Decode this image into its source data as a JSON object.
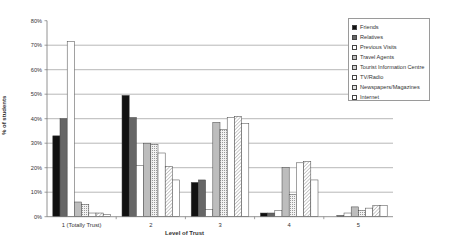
{
  "chart_data": {
    "type": "bar",
    "title": "",
    "xlabel": "Level of Trust",
    "ylabel": "% of students",
    "ylim": [
      0,
      80
    ],
    "yticks": [
      "0%",
      "10%",
      "20%",
      "30%",
      "40%",
      "50%",
      "60%",
      "70%",
      "80%"
    ],
    "grid": true,
    "legend_position": "right",
    "categories": [
      "1 (Totally Trust)",
      "2",
      "3",
      "4",
      "5"
    ],
    "series": [
      {
        "name": "Friends",
        "values": [
          33,
          49.5,
          14,
          1.5,
          0
        ],
        "fill": "#111111",
        "pattern": "solid"
      },
      {
        "name": "Relatives",
        "values": [
          40,
          40.5,
          15,
          1.5,
          0.5
        ],
        "fill": "#666666",
        "pattern": "solid"
      },
      {
        "name": "Previous Visits",
        "values": [
          71.5,
          21,
          3,
          2.5,
          1.5
        ],
        "fill": "#ffffff",
        "pattern": "solid"
      },
      {
        "name": "Travel Agents",
        "values": [
          6,
          30,
          38.5,
          20,
          4
        ],
        "fill": "#bdbdbd",
        "pattern": "solid"
      },
      {
        "name": "Tourist Information Centre",
        "values": [
          5,
          29.5,
          35.5,
          9,
          2.5
        ],
        "fill": "#e6e6e6",
        "pattern": "dots"
      },
      {
        "name": "TV/Radio",
        "values": [
          1.5,
          26,
          40.5,
          22,
          3.5
        ],
        "fill": "#ffffff",
        "pattern": "solid"
      },
      {
        "name": "Newspapers/Magazines",
        "values": [
          1.5,
          20.5,
          41,
          22.5,
          4.5
        ],
        "fill": "#eeeeee",
        "pattern": "hatch"
      },
      {
        "name": "Internet",
        "values": [
          1,
          15,
          38,
          15,
          4.5
        ],
        "fill": "#ffffff",
        "pattern": "solid"
      }
    ]
  },
  "labels": {
    "xlabel": "Level of Trust",
    "ylabel": "% of students"
  },
  "colors": {
    "grid": "#999999",
    "axis": "#777777",
    "bar_stroke": "#444444",
    "text": "#333333"
  }
}
